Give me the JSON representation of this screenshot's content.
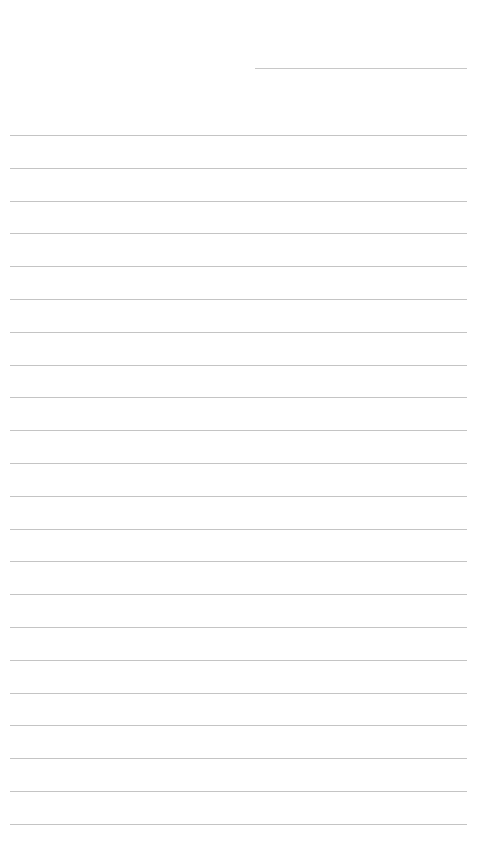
{
  "page": {
    "type": "lined-paper",
    "background": "#ffffff",
    "line_color": "#c4c4c4",
    "header_line": {
      "x": 255,
      "y": 68,
      "width": 212
    },
    "rules": {
      "count": 22,
      "start_y": 135,
      "spacing": 32.8,
      "x": 10,
      "width": 457
    }
  }
}
